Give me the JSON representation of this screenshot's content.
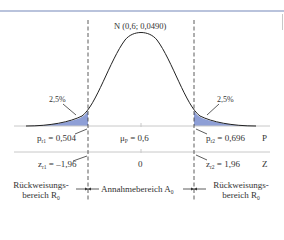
{
  "diagram": {
    "title": "N (0,6; 0,0490)",
    "tail_left_pct": "2,5%",
    "tail_right_pct": "2,5%",
    "p_axis": {
      "axis_label": "P",
      "left_crit": {
        "symbol": "p",
        "sub": "r1",
        "value": " = 0,504"
      },
      "center": {
        "symbol": "μ",
        "sub": "P",
        "value": " = 0,6"
      },
      "right_crit": {
        "symbol": "p",
        "sub": "r2",
        "value": " = 0,696"
      }
    },
    "z_axis": {
      "axis_label": "Z",
      "left_crit": {
        "symbol": "z",
        "sub": "r1",
        "value": " = –1,96"
      },
      "center": {
        "value": "0"
      },
      "right_crit": {
        "symbol": "z",
        "sub": "r2",
        "value": " = 1,96"
      }
    },
    "regions": {
      "left_line1": "Rückweisungs-",
      "left_line2": "bereich R",
      "left_sub": "0",
      "middle": "Annahmebereich A",
      "middle_sub": "0",
      "right_line1": "Rückweisungs-",
      "right_line2": "bereich R",
      "right_sub": "0"
    },
    "colors": {
      "tail_fill": "#8e9fd6",
      "curve": "#222222",
      "axis": "#c8c8c8",
      "topline": "#b9c3dc"
    }
  }
}
